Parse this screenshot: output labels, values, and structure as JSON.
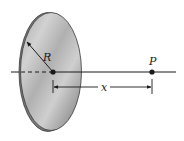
{
  "figure": {
    "type": "charged-disk-axis-diagram",
    "labels": {
      "radius": "R",
      "point": "P",
      "distance": "x"
    },
    "colors": {
      "disk_fill_light": "#c8c8c8",
      "disk_fill_dark": "#8e8e8e",
      "rim": "#6a6a6a",
      "line": "#1a1a1a",
      "background": "#ffffff"
    }
  }
}
